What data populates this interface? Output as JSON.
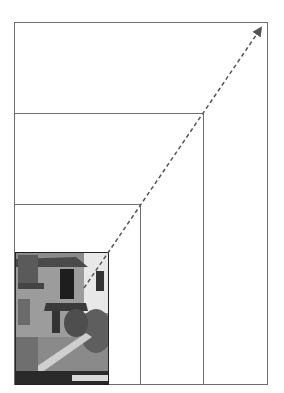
{
  "diagram": {
    "colors": {
      "frame": "#6e6e6e",
      "arrow": "#555555",
      "background": "#ffffff"
    },
    "frames": [
      {
        "name": "frame-largest",
        "x": 14,
        "y": 22,
        "w": 254,
        "h": 363
      },
      {
        "name": "frame-large",
        "x": 14,
        "y": 113,
        "w": 190,
        "h": 272
      },
      {
        "name": "frame-medium",
        "x": 14,
        "y": 204,
        "w": 127,
        "h": 181
      },
      {
        "name": "frame-photo",
        "x": 15,
        "y": 252,
        "w": 94,
        "h": 133
      }
    ],
    "arrow": {
      "x1": 84,
      "y1": 288,
      "x2": 263,
      "y2": 25,
      "style": "dashed"
    },
    "photo": {
      "subject": "black-and-white photo of a house with exterior stairs and foliage"
    }
  }
}
